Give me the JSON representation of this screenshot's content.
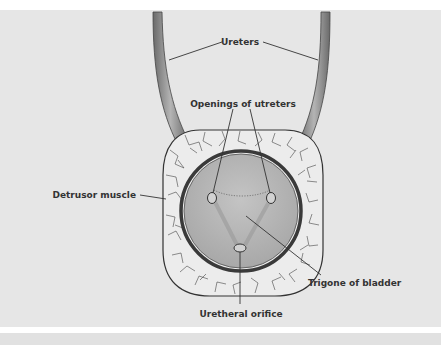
{
  "figure": {
    "type": "anatomical diagram",
    "labels": {
      "ureters": "Ureters",
      "openings": "Openings of utreters",
      "detrusor": "Detrusor muscle",
      "trigone": "Trigone of bladder",
      "urethral": "Uretheral orifice"
    },
    "colors": {
      "panel_bg": "#e6e6e6",
      "muscle_fill": "#ececec",
      "lumen_fill": "#b8b8b8",
      "lumen_wall": "#555555",
      "ureter_fill": "#9a9a9a",
      "line": "#333333"
    }
  }
}
